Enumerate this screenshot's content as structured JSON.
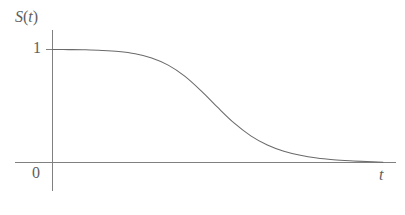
{
  "figure": {
    "name": "survival-function-plot",
    "background_color": "#ffffff",
    "line_color": "#6a6a6a",
    "axis_color": "#777777",
    "text_color": "#5e5e5e",
    "width": 405,
    "height": 215
  },
  "labels": {
    "y_axis": {
      "symbol": "S",
      "open_paren": "(",
      "arg": "t",
      "close_paren": ")",
      "full": "S(t)"
    },
    "x_axis": "t",
    "tick_one": "1",
    "origin": "0"
  },
  "chart_data": {
    "type": "line",
    "title": "",
    "xlabel": "t",
    "ylabel": "S(t)",
    "xlim": [
      0,
      1
    ],
    "ylim": [
      0,
      1.08
    ],
    "grid": false,
    "legend": null,
    "axis_ticks": {
      "x": [],
      "y": [
        {
          "value": 0,
          "label": "0"
        },
        {
          "value": 1,
          "label": "1"
        }
      ]
    },
    "annotations": [],
    "series": [
      {
        "name": "S(t)",
        "description": "Survival function: starts at 1, stays flat, decreases sigmoidally through an inflection near t=0.45, and asymptotes to 0.",
        "x": [
          0.0,
          0.05,
          0.1,
          0.15,
          0.2,
          0.25,
          0.3,
          0.35,
          0.4,
          0.45,
          0.5,
          0.55,
          0.6,
          0.65,
          0.7,
          0.75,
          0.8,
          0.85,
          0.9,
          0.95,
          1.0
        ],
        "y": [
          1.0,
          0.999,
          0.997,
          0.992,
          0.982,
          0.962,
          0.925,
          0.862,
          0.765,
          0.634,
          0.487,
          0.348,
          0.236,
          0.155,
          0.1,
          0.064,
          0.04,
          0.025,
          0.015,
          0.008,
          0.003
        ]
      }
    ]
  }
}
